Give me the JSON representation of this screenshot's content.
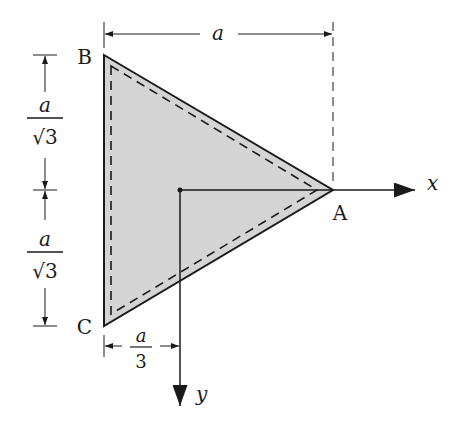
{
  "diagram": {
    "vertices": {
      "top": "B",
      "bottom": "C",
      "right": "A"
    },
    "axes": {
      "horizontal": "x",
      "vertical": "y"
    },
    "dimensions": {
      "width": {
        "numerator": "a",
        "denominator": ""
      },
      "upper_height": {
        "numerator": "a",
        "denominator": "√3"
      },
      "lower_height": {
        "numerator": "a",
        "denominator": "√3"
      },
      "centroid_offset": {
        "numerator": "a",
        "denominator": "3"
      }
    },
    "colors": {
      "fill": "#d4d4d4",
      "stroke": "#1a1a1a"
    }
  }
}
